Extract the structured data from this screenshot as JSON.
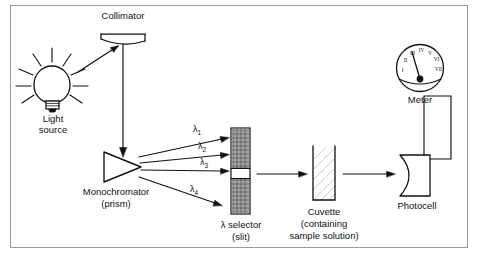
{
  "diagram": {
    "title_visible": false,
    "border_color": "#9a9a9a",
    "background": "#ffffff",
    "stroke_color": "#111111"
  },
  "labels": {
    "collimator": "Collimator",
    "light_source_line1": "Light",
    "light_source_line2": "source",
    "monochromator_line1": "Monochromator",
    "monochromator_line2": "(prism)",
    "selector_line1": "λ selector",
    "selector_line2": "(slit)",
    "cuvette_line1": "Cuvette",
    "cuvette_line2": "(containing",
    "cuvette_line3": "sample solution)",
    "photocell": "Photocell",
    "meter": "Meter"
  },
  "wavelengths": [
    {
      "symbol": "λ",
      "subscript": "1"
    },
    {
      "symbol": "λ",
      "subscript": "2"
    },
    {
      "symbol": "λ",
      "subscript": "3"
    },
    {
      "symbol": "λ",
      "subscript": "4"
    }
  ],
  "meter_dial": {
    "ticks": [
      "I",
      "II",
      "III",
      "IV",
      "V",
      "VI",
      "VII"
    ],
    "needle_pointing_to": "III"
  },
  "components": [
    "light source (bulb)",
    "collimator (concave mirror)",
    "monochromator (prism)",
    "lambda selector (slit)",
    "cuvette (sample solution)",
    "photocell",
    "meter"
  ]
}
